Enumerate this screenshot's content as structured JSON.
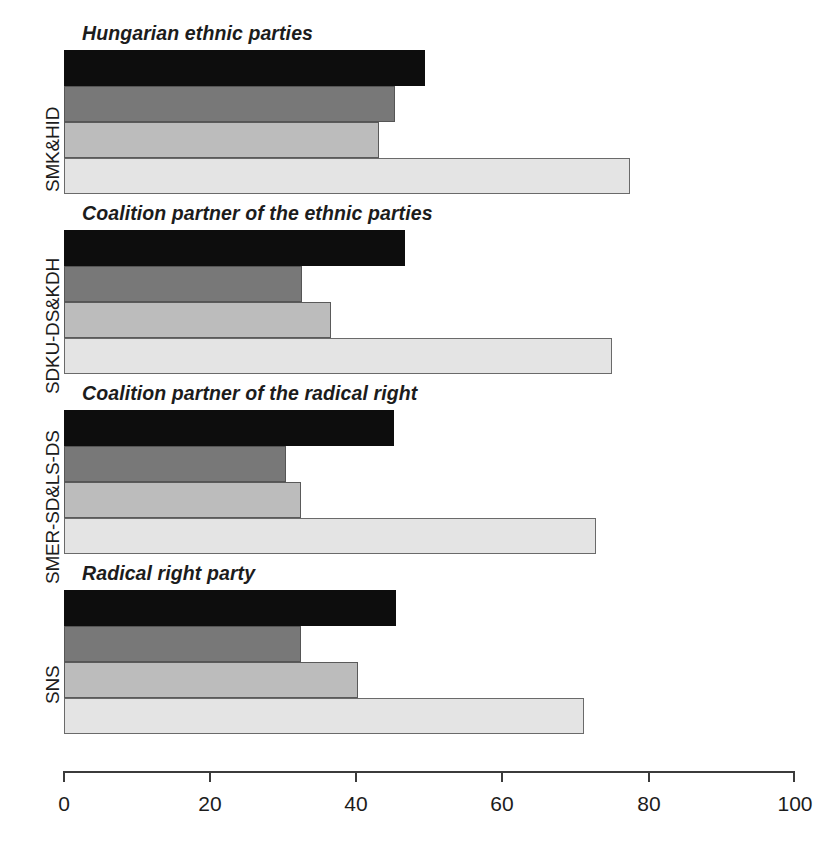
{
  "chart_data": {
    "type": "bar",
    "orientation": "horizontal",
    "title": "",
    "subtitle": "",
    "xlabel": "",
    "ylabel": "",
    "xlim": [
      0,
      100
    ],
    "xticks": [
      0,
      20,
      40,
      60,
      80,
      100
    ],
    "xtick_labels": [
      "0",
      "20",
      "40",
      "60",
      "80",
      "100"
    ],
    "grid": false,
    "legend": "none",
    "categories": [
      "SMK&HID",
      "SDKU-DS&KDH",
      "SMER-SD&LS-DS",
      "SNS"
    ],
    "panel_titles": [
      "Hungarian ethnic parties",
      "Coalition partner of the ethnic parties",
      "Coalition partner of the radical right",
      "Radical right party"
    ],
    "series": [
      {
        "name": "series-1",
        "color": "#0d0d0d",
        "values": [
          49.4,
          46.6,
          45.2,
          45.4
        ]
      },
      {
        "name": "series-2",
        "color": "#787878",
        "values": [
          45.3,
          32.6,
          30.4,
          32.4
        ]
      },
      {
        "name": "series-3",
        "color": "#bcbcbc",
        "values": [
          43.1,
          36.5,
          32.4,
          40.2
        ]
      },
      {
        "name": "series-4",
        "color": "#e4e4e4",
        "values": [
          77.4,
          74.9,
          72.8,
          71.1
        ]
      }
    ],
    "groups": [
      {
        "panel_title": "Hungarian ethnic parties",
        "category": "SMK&HID",
        "values": [
          49.4,
          45.3,
          43.1,
          77.4
        ]
      },
      {
        "panel_title": "Coalition partner of the ethnic parties",
        "category": "SDKU-DS&KDH",
        "values": [
          46.6,
          32.6,
          36.5,
          74.9
        ]
      },
      {
        "panel_title": "Coalition partner of the radical right",
        "category": "SMER-SD&LS-DS",
        "values": [
          45.2,
          30.4,
          32.4,
          72.8
        ]
      },
      {
        "panel_title": "Radical right party",
        "category": "SNS",
        "values": [
          45.4,
          32.4,
          40.2,
          71.1
        ]
      }
    ],
    "colors": {
      "series_1": "#0d0d0d",
      "series_2": "#787878",
      "series_3": "#bcbcbc",
      "series_4": "#e4e4e4",
      "axis": "#3b3b3b",
      "text": "#1c1c1c",
      "background": "#ffffff"
    }
  },
  "axis": {
    "ticks": [
      {
        "label": "0",
        "value": 0
      },
      {
        "label": "20",
        "value": 20
      },
      {
        "label": "40",
        "value": 40
      },
      {
        "label": "60",
        "value": 60
      },
      {
        "label": "80",
        "value": 80
      },
      {
        "label": "100",
        "value": 100
      }
    ]
  }
}
